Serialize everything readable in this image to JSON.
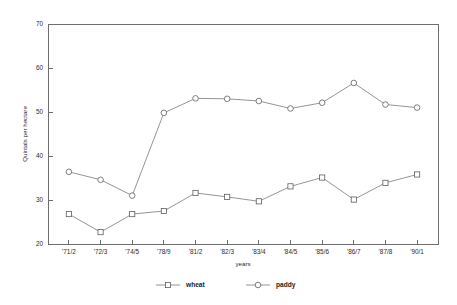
{
  "chart_data": {
    "type": "line",
    "title": "",
    "xlabel": "years",
    "ylabel": "Quintals per hectare",
    "categories": [
      "'71/2",
      "'72/3",
      "'74/5",
      "'78/9",
      "'81/2",
      "'82/3",
      "'83/4",
      "'84/5",
      "'85/6",
      "'86/7",
      "'87/8",
      "'90/1"
    ],
    "ylim": [
      20,
      70
    ],
    "yticks": [
      20,
      30,
      40,
      50,
      60,
      70
    ],
    "ytick_labels": [
      "20",
      "30",
      "40",
      "50",
      "60",
      "70"
    ],
    "grid": false,
    "legend_position": "bottom",
    "series": [
      {
        "name": "wheat",
        "marker": "square",
        "values": [
          26.8,
          22.7,
          26.8,
          27.5,
          31.6,
          30.7,
          29.7,
          33.1,
          35.1,
          30.1,
          33.9,
          35.8
        ]
      },
      {
        "name": "paddy",
        "marker": "circle",
        "values": [
          36.4,
          34.6,
          31.0,
          49.8,
          53.1,
          53.0,
          52.5,
          50.8,
          52.1,
          56.6,
          51.7,
          51.0
        ]
      }
    ]
  },
  "legend": {
    "items": [
      {
        "label": "wheat"
      },
      {
        "label": "paddy"
      }
    ]
  },
  "axes": {
    "y_title": "Quintals per hectare",
    "x_title": "years"
  }
}
